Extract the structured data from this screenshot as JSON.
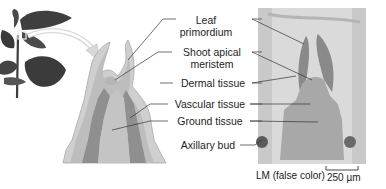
{
  "figure": {
    "labels": [
      {
        "id": "leaf-primordium",
        "line1": "Leaf",
        "line2": "primordium"
      },
      {
        "id": "shoot-apical-meristem",
        "line1": "Shoot apical",
        "line2": "meristem"
      },
      {
        "id": "dermal-tissue",
        "line1": "Dermal tissue"
      },
      {
        "id": "vascular-tissue",
        "line1": "Vascular tissue"
      },
      {
        "id": "ground-tissue",
        "line1": "Ground tissue"
      },
      {
        "id": "axillary-bud",
        "line1": "Axillary bud"
      }
    ],
    "caption": "LM (false color)",
    "scale_bar": "250 µm",
    "colors": {
      "plant": "#3a3a3a",
      "diagram_outer": "#c8c8c8",
      "diagram_dermal": "#b0b0b0",
      "diagram_vascular": "#8e8e8e",
      "diagram_ground": "#bdbdbd",
      "micrograph_bg": "#d9d9d9",
      "leader_line": "#333333"
    }
  }
}
